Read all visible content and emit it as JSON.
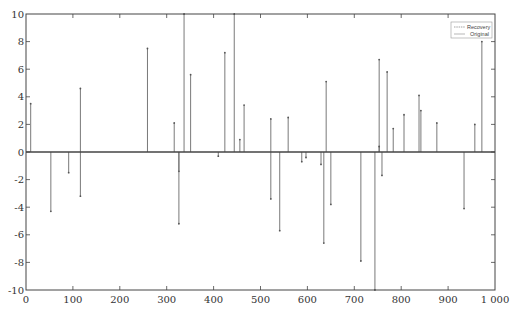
{
  "chart_data": {
    "type": "stem",
    "title": "",
    "xlabel": "",
    "ylabel": "",
    "xlim": [
      0,
      1000
    ],
    "ylim": [
      -10,
      10
    ],
    "grid": false,
    "legend_position": "upper right",
    "x_ticks": [
      0,
      100,
      200,
      300,
      400,
      500,
      600,
      700,
      800,
      900,
      1000
    ],
    "x_tick_labels": [
      "0",
      "100",
      "200",
      "300",
      "400",
      "500",
      "600",
      "700",
      "800",
      "900",
      "1 000"
    ],
    "y_ticks": [
      10,
      8,
      6,
      4,
      2,
      0,
      -2,
      -4,
      -6,
      -8,
      -10
    ],
    "y_tick_labels": [
      "10",
      "8",
      "6",
      "4",
      "2",
      "0",
      "-2",
      "-4",
      "-6",
      "-8",
      "-10"
    ],
    "series": [
      {
        "name": "Recovery",
        "style": "stem with dot markers",
        "color": "#555555",
        "points": [
          [
            10,
            3.5
          ],
          [
            53,
            -4.3
          ],
          [
            91,
            -1.5
          ],
          [
            116,
            4.6
          ],
          [
            116,
            -3.2
          ],
          [
            259,
            7.5
          ],
          [
            316,
            2.1
          ],
          [
            326,
            -1.4
          ],
          [
            326,
            -5.2
          ],
          [
            337,
            10
          ],
          [
            351,
            5.6
          ],
          [
            410,
            -0.3
          ],
          [
            424,
            7.2
          ],
          [
            444,
            10
          ],
          [
            456,
            0.9
          ],
          [
            465,
            3.4
          ],
          [
            522,
            2.4
          ],
          [
            522,
            -3.4
          ],
          [
            541,
            -5.7
          ],
          [
            559,
            2.5
          ],
          [
            588,
            -0.7
          ],
          [
            597,
            -0.4
          ],
          [
            629,
            -0.9
          ],
          [
            635,
            -6.6
          ],
          [
            640,
            5.1
          ],
          [
            650,
            -3.8
          ],
          [
            714,
            -7.9
          ],
          [
            744,
            -10
          ],
          [
            753,
            6.7
          ],
          [
            753,
            0.4
          ],
          [
            759,
            -1.7
          ],
          [
            770,
            5.8
          ],
          [
            783,
            1.7
          ],
          [
            806,
            2.7
          ],
          [
            838,
            4.1
          ],
          [
            842,
            3.0
          ],
          [
            876,
            2.1
          ],
          [
            934,
            -4.1
          ],
          [
            957,
            2.0
          ],
          [
            972,
            8.0
          ]
        ]
      },
      {
        "name": "Original",
        "style": "stem line",
        "color": "#777777",
        "points": "same as Recovery (overlapping)"
      }
    ]
  },
  "legend": {
    "items": [
      {
        "label": "Recovery"
      },
      {
        "label": "Original"
      }
    ]
  }
}
